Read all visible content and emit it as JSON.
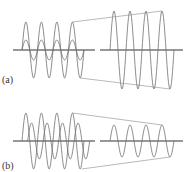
{
  "panels": [
    {
      "label": "(a)",
      "axis_y": 50,
      "left_waves": [
        {
          "amplitude": 28,
          "phase": 0
        },
        {
          "amplitude": 10,
          "phase": 0
        }
      ],
      "result_amplitude": 39,
      "description": "constructive interference"
    },
    {
      "label": "(b)",
      "axis_y": 141,
      "left_waves": [
        {
          "amplitude": 28,
          "phase": 0
        },
        {
          "amplitude": 18,
          "phase": 2.3
        }
      ],
      "result_amplitude": 16,
      "description": "partial interference"
    }
  ],
  "colors": {
    "wave": "#707070",
    "axis": "#333333",
    "guide": "#8a8a8a"
  }
}
